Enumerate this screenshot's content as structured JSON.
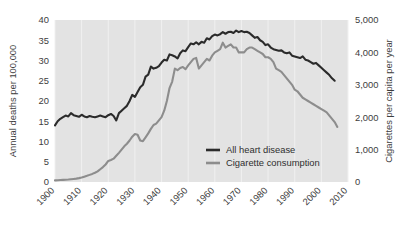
{
  "chart_data": {
    "type": "line",
    "title": "",
    "subtitle": "",
    "xlabel": "",
    "ylabel": "Annual deaths per 100,000",
    "y2label": "Cigarettes per capita per year",
    "grid": "vertical-only",
    "legend_position": "inside-lower-right",
    "xlim": [
      1900,
      2010
    ],
    "ylim": [
      0,
      40
    ],
    "y2lim": [
      0,
      5000
    ],
    "xticks": [
      "1900",
      "1910",
      "1920",
      "1930",
      "1940",
      "1950",
      "1960",
      "1970",
      "1980",
      "1990",
      "2000",
      "2010"
    ],
    "yticks": [
      "0",
      "5",
      "10",
      "15",
      "20",
      "25",
      "30",
      "35",
      "40"
    ],
    "y2ticks": [
      "0",
      "1,000",
      "2,000",
      "3,000",
      "4,000",
      "5,000"
    ],
    "series": [
      {
        "name": "All heart disease",
        "axis": "left",
        "color": "#2b2b2b",
        "units": "Annual deaths per 100,000",
        "x": [
          1900,
          1901,
          1902,
          1903,
          1904,
          1905,
          1906,
          1907,
          1908,
          1909,
          1910,
          1911,
          1912,
          1913,
          1914,
          1915,
          1916,
          1917,
          1918,
          1919,
          1920,
          1921,
          1922,
          1923,
          1924,
          1925,
          1926,
          1927,
          1928,
          1929,
          1930,
          1931,
          1932,
          1933,
          1934,
          1935,
          1936,
          1937,
          1938,
          1939,
          1940,
          1941,
          1942,
          1943,
          1944,
          1945,
          1946,
          1947,
          1948,
          1949,
          1950,
          1951,
          1952,
          1953,
          1954,
          1955,
          1956,
          1957,
          1958,
          1959,
          1960,
          1961,
          1962,
          1963,
          1964,
          1965,
          1966,
          1967,
          1968,
          1969,
          1970,
          1971,
          1972,
          1973,
          1974,
          1975,
          1976,
          1977,
          1978,
          1979,
          1980,
          1981,
          1982,
          1983,
          1984,
          1985,
          1986,
          1987,
          1988,
          1989,
          1990,
          1991,
          1992,
          1993,
          1994,
          1995,
          1996,
          1997,
          1998,
          1999,
          2000,
          2001,
          2002,
          2003,
          2004,
          2005
        ],
        "values": [
          14.0,
          15.0,
          15.6,
          16.0,
          16.4,
          16.2,
          17.0,
          16.5,
          16.3,
          16.1,
          16.6,
          16.2,
          16.0,
          16.3,
          16.1,
          16.0,
          16.2,
          16.4,
          16.2,
          16.0,
          16.5,
          16.8,
          16.3,
          15.2,
          17.0,
          17.6,
          18.2,
          18.8,
          20.0,
          21.5,
          21.0,
          22.2,
          23.4,
          24.0,
          26.0,
          26.5,
          28.5,
          28.0,
          28.2,
          28.6,
          29.5,
          30.2,
          30.0,
          31.5,
          31.3,
          31.0,
          30.5,
          31.8,
          32.5,
          32.3,
          33.3,
          34.2,
          34.0,
          34.5,
          34.0,
          34.6,
          34.4,
          35.5,
          35.2,
          36.0,
          36.4,
          36.2,
          36.5,
          37.0,
          36.6,
          37.0,
          37.1,
          36.8,
          37.4,
          37.0,
          37.3,
          37.0,
          37.1,
          36.8,
          36.2,
          35.6,
          35.8,
          35.0,
          34.6,
          33.8,
          34.0,
          33.2,
          32.8,
          32.6,
          32.4,
          32.5,
          32.0,
          31.8,
          32.0,
          31.2,
          31.0,
          30.8,
          30.6,
          31.0,
          30.2,
          30.0,
          29.6,
          29.2,
          29.4,
          28.8,
          28.2,
          27.6,
          27.0,
          26.4,
          25.6,
          25.0
        ]
      },
      {
        "name": "Cigarette consumption",
        "axis": "right",
        "color": "#8d8d8d",
        "units": "Cigarettes per capita per year",
        "x": [
          1900,
          1901,
          1902,
          1903,
          1904,
          1905,
          1906,
          1907,
          1908,
          1909,
          1910,
          1911,
          1912,
          1913,
          1914,
          1915,
          1916,
          1917,
          1918,
          1919,
          1920,
          1921,
          1922,
          1923,
          1924,
          1925,
          1926,
          1927,
          1928,
          1929,
          1930,
          1931,
          1932,
          1933,
          1934,
          1935,
          1936,
          1937,
          1938,
          1939,
          1940,
          1941,
          1942,
          1943,
          1944,
          1945,
          1946,
          1947,
          1948,
          1949,
          1950,
          1951,
          1952,
          1953,
          1954,
          1955,
          1956,
          1957,
          1958,
          1959,
          1960,
          1961,
          1962,
          1963,
          1964,
          1965,
          1966,
          1967,
          1968,
          1969,
          1970,
          1971,
          1972,
          1973,
          1974,
          1975,
          1976,
          1977,
          1978,
          1979,
          1980,
          1981,
          1982,
          1983,
          1984,
          1985,
          1986,
          1987,
          1988,
          1989,
          1990,
          1991,
          1992,
          1993,
          1994,
          1995,
          1996,
          1997,
          1998,
          1999,
          2000,
          2001,
          2002,
          2003,
          2004,
          2005,
          2006
        ],
        "values": [
          50,
          55,
          60,
          65,
          70,
          75,
          85,
          95,
          105,
          120,
          140,
          165,
          190,
          220,
          250,
          285,
          330,
          395,
          460,
          540,
          650,
          680,
          720,
          810,
          900,
          1000,
          1100,
          1180,
          1280,
          1400,
          1480,
          1460,
          1280,
          1260,
          1380,
          1500,
          1640,
          1760,
          1800,
          1900,
          2000,
          2200,
          2500,
          2900,
          3100,
          3500,
          3450,
          3520,
          3550,
          3480,
          3600,
          3700,
          3800,
          3830,
          3500,
          3600,
          3700,
          3800,
          3750,
          3900,
          4000,
          4050,
          4100,
          4300,
          4150,
          4200,
          4250,
          4150,
          4150,
          4000,
          4000,
          4000,
          4100,
          4150,
          4150,
          4100,
          4050,
          4000,
          3950,
          3850,
          3850,
          3800,
          3700,
          3500,
          3450,
          3400,
          3300,
          3200,
          3100,
          3000,
          2850,
          2800,
          2700,
          2600,
          2550,
          2500,
          2450,
          2400,
          2350,
          2300,
          2250,
          2200,
          2150,
          2050,
          1950,
          1850,
          1700
        ]
      }
    ],
    "legend": [
      {
        "label": "All heart disease",
        "color": "#2b2b2b"
      },
      {
        "label": "Cigarette consumption",
        "color": "#8d8d8d"
      }
    ]
  },
  "colors": {
    "plot_background": "#e3e3e3",
    "page_background": "#ffffff",
    "heart_disease_line": "#2b2b2b",
    "cigarette_line": "#8d8d8d",
    "text": "#3d3d3d",
    "gridline": "#f0f0f0"
  }
}
